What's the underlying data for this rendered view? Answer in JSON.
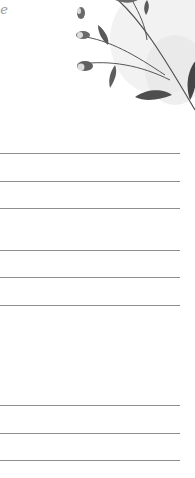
{
  "header": {
    "script_fragment": "le"
  },
  "decoration": {
    "icon": "botanical-leaf-branch-icon",
    "colors": {
      "leaf_dark": "#4a4a4a",
      "leaf_mid": "#7a7a7a",
      "wash": "#e6e6e6"
    }
  },
  "lines": {
    "color": "#8e8e8e",
    "groups": [
      {
        "y": [
          153,
          181,
          208
        ]
      },
      {
        "y": [
          250,
          277,
          305
        ]
      },
      {
        "y": [
          405,
          433,
          460
        ]
      }
    ]
  }
}
